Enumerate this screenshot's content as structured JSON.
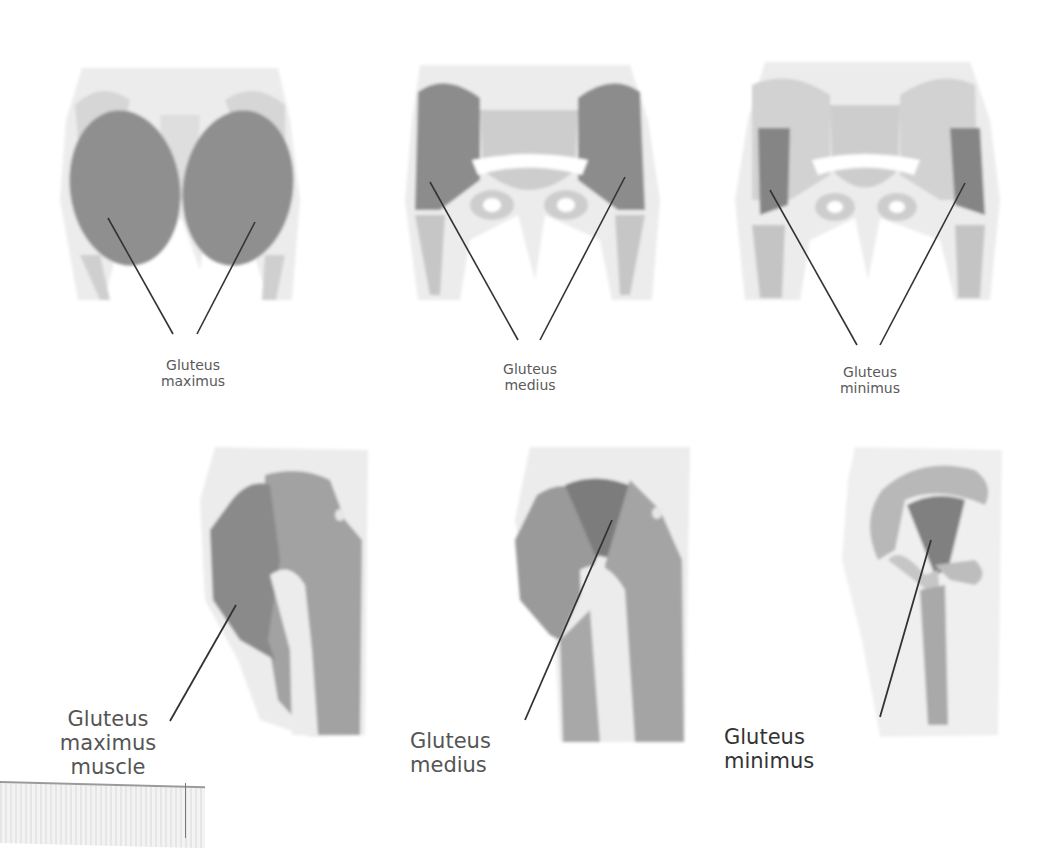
{
  "figure": {
    "top_row": [
      {
        "id": "posterior-maximus",
        "label": "Gluteus\nmaximus",
        "muscle": "gluteus maximus",
        "view": "posterior"
      },
      {
        "id": "posterior-medius",
        "label": "Gluteus\nmedius",
        "muscle": "gluteus medius",
        "view": "posterior"
      },
      {
        "id": "posterior-minimus",
        "label": "Gluteus\nminimus",
        "muscle": "gluteus minimus",
        "view": "posterior"
      }
    ],
    "bottom_row": [
      {
        "id": "lateral-maximus",
        "label": "Gluteus\nmaximus\nmuscle",
        "muscle": "gluteus maximus",
        "view": "lateral"
      },
      {
        "id": "lateral-medius",
        "label": "Gluteus\nmedius",
        "muscle": "gluteus medius",
        "view": "lateral"
      },
      {
        "id": "lateral-minimus",
        "label": "Gluteus\nminimus",
        "muscle": "gluteus minimus",
        "view": "lateral"
      }
    ]
  },
  "colors": {
    "skin": "#ebebeb",
    "bone": "#cfcfcf",
    "muscle": "#9a9a9a",
    "muscle_highlight": "#7a7a7a",
    "leader_line": "#333333",
    "label_text": "#555555"
  }
}
